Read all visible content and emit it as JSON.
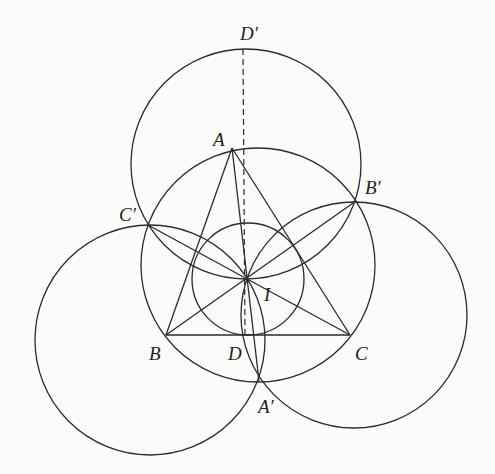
{
  "diagram": {
    "type": "geometry",
    "points": {
      "A": {
        "label": "A",
        "x": 232,
        "y": 148,
        "label_x": 213,
        "label_y": 130
      },
      "B": {
        "label": "B",
        "x": 166,
        "y": 335,
        "label_x": 149,
        "label_y": 344
      },
      "C": {
        "label": "C",
        "x": 350,
        "y": 335,
        "label_x": 355,
        "label_y": 344
      },
      "D": {
        "label": "D",
        "x": 245,
        "y": 335,
        "label_x": 228,
        "label_y": 344
      },
      "I": {
        "label": "I",
        "x": 248,
        "y": 278,
        "label_x": 264,
        "label_y": 285
      },
      "A'": {
        "label": "A′",
        "x": 259,
        "y": 381,
        "label_x": 258,
        "label_y": 397
      },
      "B'": {
        "label": "B′",
        "x": 356,
        "y": 201,
        "label_x": 365,
        "label_y": 178
      },
      "C'": {
        "label": "C′",
        "x": 148,
        "y": 225,
        "label_x": 119,
        "label_y": 205
      },
      "D'": {
        "label": "D′",
        "x": 243,
        "y": 49,
        "label_x": 240,
        "label_y": 24
      }
    },
    "circles": [
      {
        "name": "top-circle-through-D-prime",
        "cx": 246,
        "cy": 164,
        "r": 115
      },
      {
        "name": "circumcircle",
        "cx": 258,
        "cy": 265,
        "r": 117
      },
      {
        "name": "left-circle",
        "cx": 150,
        "cy": 340,
        "r": 115
      },
      {
        "name": "right-circle",
        "cx": 354,
        "cy": 315,
        "r": 113
      },
      {
        "name": "incircle",
        "cx": 248,
        "cy": 279,
        "r": 56
      }
    ],
    "segments": [
      {
        "name": "side-AB",
        "from": "A",
        "to": "B"
      },
      {
        "name": "side-AC",
        "from": "A",
        "to": "C"
      },
      {
        "name": "side-BC",
        "from": "B",
        "to": "C"
      },
      {
        "name": "line-A-I-A-prime",
        "from": "A",
        "to": "A'"
      },
      {
        "name": "line-B-B-prime",
        "from": "B",
        "to": "B'"
      },
      {
        "name": "line-C-C-prime",
        "from": "C",
        "to": "C'"
      }
    ],
    "dashed_segments": [
      {
        "name": "dashed-D-prime-D",
        "from": "D'",
        "to": "D"
      }
    ]
  }
}
